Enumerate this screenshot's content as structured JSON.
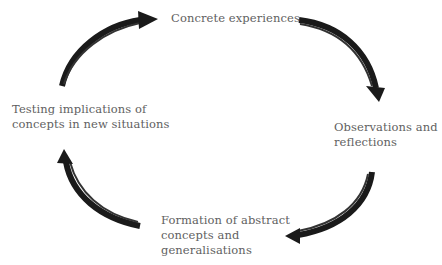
{
  "diagram": {
    "type": "cycle",
    "title": "",
    "direction": "clockwise",
    "colors": {
      "text": "#5f5f5f",
      "arrow": "#1a1a1a",
      "background": "#ffffff"
    },
    "stages": [
      {
        "id": "concrete",
        "position": "top",
        "lines": [
          "Concrete experiences"
        ]
      },
      {
        "id": "observations",
        "position": "right",
        "lines": [
          "Observations and",
          "reflections"
        ]
      },
      {
        "id": "formation",
        "position": "bottom",
        "lines": [
          "Formation of abstract",
          "concepts and",
          "generalisations"
        ]
      },
      {
        "id": "testing",
        "position": "left",
        "lines": [
          "Testing implications of",
          "concepts in new situations"
        ]
      }
    ],
    "arrows": [
      {
        "from": "testing",
        "to": "concrete",
        "icon": "curved-arrow-up-right"
      },
      {
        "from": "concrete",
        "to": "observations",
        "icon": "curved-arrow-down-right"
      },
      {
        "from": "observations",
        "to": "formation",
        "icon": "curved-arrow-down-left"
      },
      {
        "from": "formation",
        "to": "testing",
        "icon": "curved-arrow-up-left"
      }
    ]
  }
}
